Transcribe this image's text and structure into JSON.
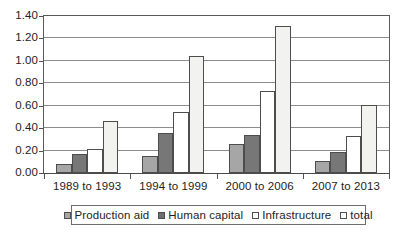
{
  "chart_data": {
    "type": "bar",
    "title": "",
    "subtitle": "",
    "xlabel": "",
    "ylabel": "",
    "categories": [
      "1989 to 1993",
      "1994 to 1999",
      "2000 to 2006",
      "2007 to 2013"
    ],
    "series": [
      {
        "name": "Production aid",
        "color": "#a6a6a6",
        "values": [
          0.08,
          0.15,
          0.26,
          0.11
        ]
      },
      {
        "name": "Human capital",
        "color": "#777777",
        "values": [
          0.17,
          0.36,
          0.34,
          0.19
        ]
      },
      {
        "name": "Infrastructure",
        "color": "#ffffff",
        "values": [
          0.21,
          0.54,
          0.73,
          0.33
        ]
      },
      {
        "name": "total",
        "color": "#f2f2f0",
        "values": [
          0.46,
          1.04,
          1.31,
          0.61
        ]
      }
    ],
    "ylim": [
      0.0,
      1.4
    ],
    "ytick_values": [
      0.0,
      0.2,
      0.4,
      0.6,
      0.8,
      1.0,
      1.2,
      1.4
    ],
    "ytick_labels": [
      "0.00",
      "0.20",
      "0.40",
      "0.60",
      "0.80",
      "1.00",
      "1.20",
      "1.40"
    ],
    "grid": true,
    "grid_axis": "y",
    "legend_position": "bottom",
    "legend_entries": [
      "Production aid",
      "Human capital",
      "Infrastructure",
      "total"
    ]
  }
}
